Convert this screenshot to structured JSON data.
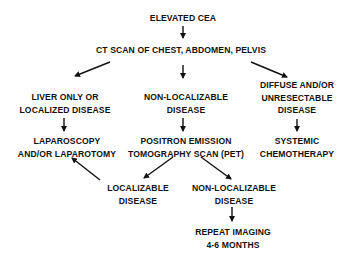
{
  "diagram": {
    "type": "flowchart",
    "nodes": {
      "elevated_cea": {
        "lines": [
          "ELEVATED CEA"
        ]
      },
      "ct_scan": {
        "lines": [
          "CT SCAN OF CHEST, ABDOMEN, PELVIS"
        ]
      },
      "liver_only": {
        "lines": [
          "LIVER ONLY OR",
          "LOCALIZED DISEASE"
        ]
      },
      "non_localizable_1": {
        "lines": [
          "NON-LOCALIZABLE",
          "DISEASE"
        ]
      },
      "diffuse": {
        "lines": [
          "DIFFUSE AND/OR",
          "UNRESECTABLE",
          "DISEASE"
        ]
      },
      "laparoscopy": {
        "lines": [
          "LAPAROSCOPY",
          "AND/OR LAPAROTOMY"
        ]
      },
      "pet_scan": {
        "lines": [
          "POSITRON EMISSION",
          "TOMOGRAPHY SCAN (PET)"
        ]
      },
      "chemotherapy": {
        "lines": [
          "SYSTEMIC",
          "CHEMOTHERAPY"
        ]
      },
      "localizable": {
        "lines": [
          "LOCALIZABLE",
          "DISEASE"
        ]
      },
      "non_localizable_2": {
        "lines": [
          "NON-LOCALIZABLE",
          "DISEASE"
        ]
      },
      "repeat_imaging": {
        "lines": [
          "REPEAT IMAGING",
          "4-6 MONTHS"
        ]
      }
    },
    "edges": [
      {
        "from": "elevated_cea",
        "to": "ct_scan"
      },
      {
        "from": "ct_scan",
        "to": "liver_only"
      },
      {
        "from": "ct_scan",
        "to": "non_localizable_1"
      },
      {
        "from": "ct_scan",
        "to": "diffuse"
      },
      {
        "from": "liver_only",
        "to": "laparoscopy"
      },
      {
        "from": "non_localizable_1",
        "to": "pet_scan"
      },
      {
        "from": "diffuse",
        "to": "chemotherapy"
      },
      {
        "from": "pet_scan",
        "to": "localizable"
      },
      {
        "from": "pet_scan",
        "to": "non_localizable_2"
      },
      {
        "from": "localizable",
        "to": "laparoscopy"
      },
      {
        "from": "non_localizable_2",
        "to": "repeat_imaging"
      }
    ],
    "colors": {
      "background": "#ffffff",
      "ink": "#111111"
    }
  }
}
